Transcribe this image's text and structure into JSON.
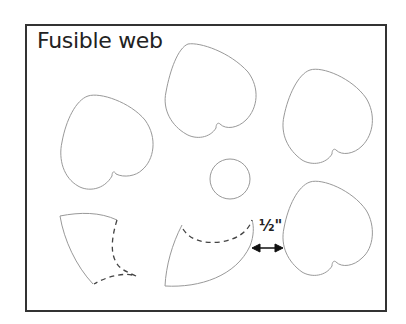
{
  "diagram": {
    "title": "Fusible web",
    "measurement_label": "½\"",
    "shapes": [
      {
        "type": "heart",
        "count": 4
      },
      {
        "type": "circle",
        "count": 1
      },
      {
        "type": "leaf-with-dashed-line",
        "count": 2
      }
    ],
    "colors": {
      "outline": "#999999",
      "dashed": "#444444",
      "frame": "#333333",
      "arrow": "#111111"
    }
  }
}
